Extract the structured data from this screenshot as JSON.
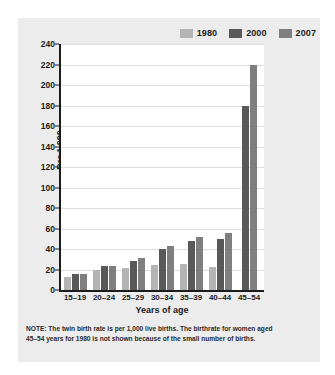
{
  "chart_data": {
    "type": "bar",
    "title": "",
    "xlabel": "Years of age",
    "ylabel": "Per 1,000",
    "ylim": [
      0,
      240
    ],
    "ytick_step": 20,
    "yticks": [
      "240",
      "220",
      "200",
      "180",
      "160",
      "140",
      "120",
      "100",
      "80",
      "60",
      "40",
      "20",
      "0"
    ],
    "grid": true,
    "legend_position": "top-right",
    "categories": [
      "15–19",
      "20–24",
      "25–29",
      "30–34",
      "35–39",
      "40–44",
      "45–54"
    ],
    "series": [
      {
        "name": "1980",
        "color": "#b4b4b4",
        "values": [
          13,
          20,
          21,
          24,
          25,
          22,
          null
        ]
      },
      {
        "name": "2000",
        "color": "#595959",
        "values": [
          16,
          23,
          28,
          40,
          48,
          50,
          180
        ]
      },
      {
        "name": "2007",
        "color": "#7f7f7f",
        "values": [
          16,
          23,
          31,
          43,
          52,
          56,
          220
        ]
      }
    ],
    "note_lines": [
      "NOTE: The twin birth rate is per 1,000 live births. The birthrate for women aged",
      "45–54 years for 1980 is not shown because of the small number of births."
    ]
  }
}
